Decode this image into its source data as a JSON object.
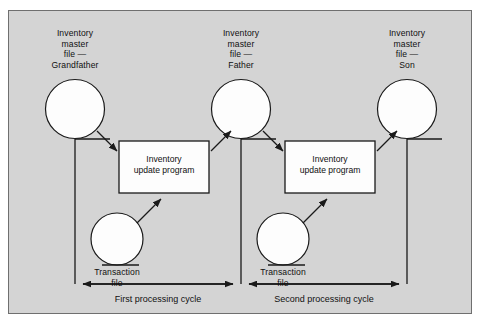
{
  "figure": {
    "type": "flowchart",
    "panel_background": "#d4d4d4",
    "border_color": "#6f6f6f",
    "line_color": "#1a1a1a",
    "shape_fill": "#fdfdfd"
  },
  "master_files": [
    {
      "id": "grandfather",
      "label": "Inventory\nmaster\nfile —\nGrandfather",
      "symbol": "magnetic-tape-reel"
    },
    {
      "id": "father",
      "label": "Inventory\nmaster\nfile —\nFather",
      "symbol": "magnetic-tape-reel"
    },
    {
      "id": "son",
      "label": "Inventory\nmaster\nfile —\nSon",
      "symbol": "magnetic-tape-reel"
    }
  ],
  "programs": [
    {
      "id": "update-program-1",
      "label": "Inventory\nupdate program",
      "symbol": "process-box"
    },
    {
      "id": "update-program-2",
      "label": "Inventory\nupdate program",
      "symbol": "process-box"
    }
  ],
  "transaction_files": [
    {
      "id": "transaction-1",
      "label": "Transaction\nfile",
      "symbol": "magnetic-tape-reel"
    },
    {
      "id": "transaction-2",
      "label": "Transaction\nfile",
      "symbol": "magnetic-tape-reel"
    }
  ],
  "cycles": [
    {
      "id": "cycle-1",
      "label": "First processing cycle"
    },
    {
      "id": "cycle-2",
      "label": "Second processing cycle"
    }
  ]
}
